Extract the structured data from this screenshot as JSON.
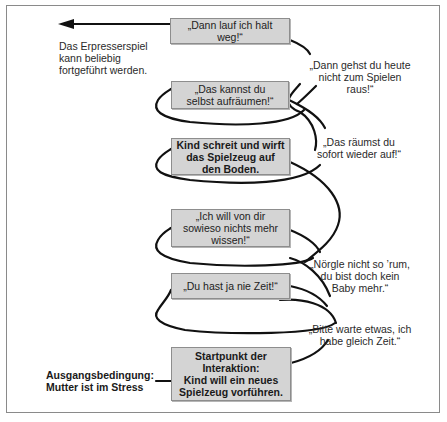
{
  "diagram": {
    "exit_note": "Das Erpresserspiel\nkann beliebig\nfortgeführt werden.",
    "start_condition": "Ausgangsbedingung:\nMutter ist im Stress",
    "child_boxes": [
      {
        "text": "„Dann lauf ich halt\nweg!“",
        "bold": false
      },
      {
        "text": "„Das kannst du\nselbst aufräumen!“",
        "bold": false
      },
      {
        "text": "Kind schreit und wirft\ndas Spielzeug auf\nden Boden.",
        "bold": true
      },
      {
        "text": "„Ich will von dir\nsowieso nichts mehr\nwissen!“",
        "bold": false
      },
      {
        "text": "„Du hast ja nie Zeit!“",
        "bold": false
      },
      {
        "text": "Startpunkt der\nInteraktion:\nKind will ein neues\nSpielzeug vorführen.",
        "bold": true
      }
    ],
    "mother_replies": [
      {
        "text": "„Dann gehst du heute\nnicht zum Spielen\nraus!“"
      },
      {
        "text": "„Das räumst du\nsofort wieder auf!“"
      },
      {
        "text": "„Nörgle nicht so ’rum,\ndu bist doch kein\nBaby mehr.“"
      },
      {
        "text": "„Bitte warte etwas, ich\nhabe gleich Zeit.“"
      }
    ],
    "colors": {
      "box_fill": "#d4d4d4",
      "box_border": "#8d8d8d",
      "line": "#111111",
      "frame": "#8a8a8a"
    }
  }
}
